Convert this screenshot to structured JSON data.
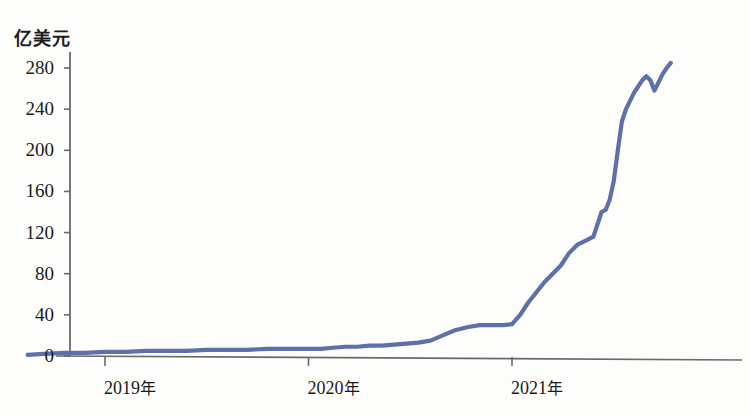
{
  "chart_data": {
    "type": "line",
    "title": "",
    "subtitle": "",
    "xlabel": "",
    "ylabel": "亿美元",
    "ylim": [
      0,
      295
    ],
    "xlim": [
      2018.62,
      2021.8
    ],
    "grid": false,
    "legend": null,
    "y_ticks": [
      0,
      40,
      80,
      120,
      160,
      200,
      240,
      280
    ],
    "y_tick_labels": [
      "0",
      "40",
      "80",
      "120",
      "160",
      "200",
      "240",
      "280"
    ],
    "x_ticks": [
      2019,
      2020,
      2021
    ],
    "x_tick_labels": [
      "2019年",
      "2020年",
      "2021年"
    ],
    "line_color": "#5f70a8",
    "axis_color": "#6a6a6a",
    "series": [
      {
        "name": "",
        "x": [
          2018.62,
          2018.7,
          2018.8,
          2018.9,
          2019.0,
          2019.1,
          2019.2,
          2019.3,
          2019.4,
          2019.5,
          2019.6,
          2019.7,
          2019.8,
          2019.9,
          2020.0,
          2020.06,
          2020.12,
          2020.18,
          2020.24,
          2020.3,
          2020.36,
          2020.42,
          2020.48,
          2020.54,
          2020.6,
          2020.66,
          2020.72,
          2020.78,
          2020.84,
          2020.88,
          2020.92,
          2020.96,
          2021.0,
          2021.04,
          2021.08,
          2021.12,
          2021.16,
          2021.2,
          2021.24,
          2021.28,
          2021.32,
          2021.36,
          2021.4,
          2021.44,
          2021.46,
          2021.48,
          2021.5,
          2021.52,
          2021.54,
          2021.56,
          2021.58,
          2021.6,
          2021.62,
          2021.64,
          2021.66,
          2021.68,
          2021.7,
          2021.72,
          2021.74,
          2021.76,
          2021.78
        ],
        "y": [
          1,
          2,
          3,
          3,
          4,
          4,
          5,
          5,
          5,
          6,
          6,
          6,
          7,
          7,
          7,
          7,
          8,
          9,
          9,
          10,
          10,
          11,
          12,
          13,
          15,
          20,
          25,
          28,
          30,
          30,
          30,
          30,
          31,
          40,
          52,
          62,
          72,
          80,
          88,
          100,
          108,
          112,
          116,
          140,
          142,
          152,
          170,
          200,
          228,
          240,
          248,
          256,
          262,
          268,
          272,
          268,
          258,
          266,
          274,
          280,
          285
        ]
      }
    ]
  }
}
